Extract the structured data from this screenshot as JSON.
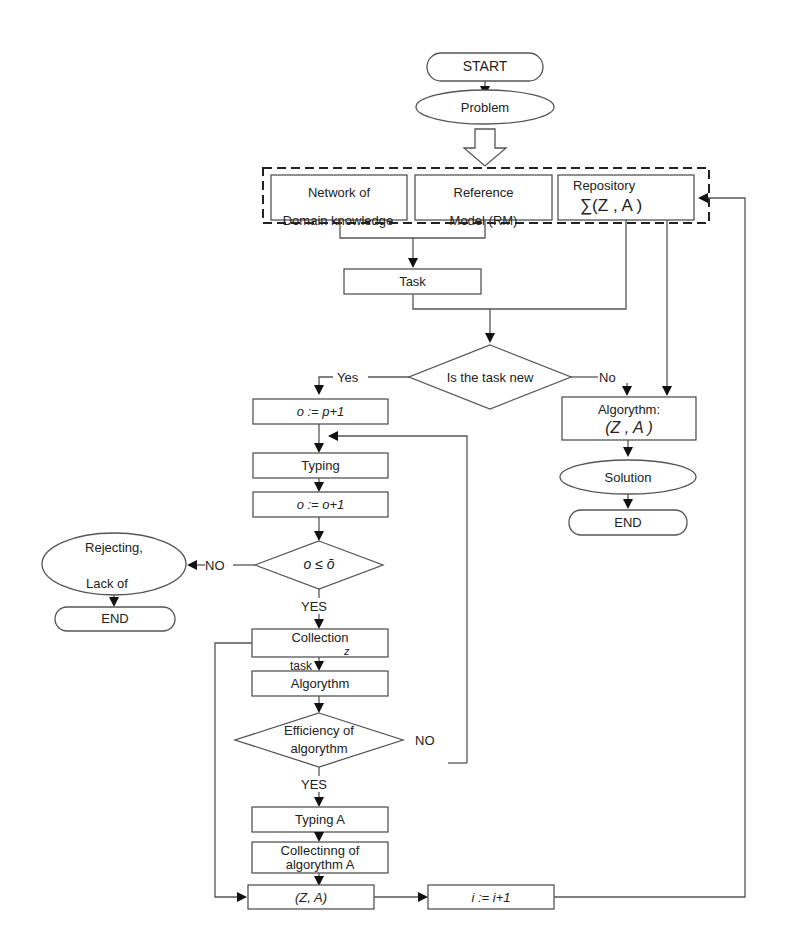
{
  "diagram": {
    "type": "flowchart",
    "nodes": {
      "start": "START",
      "problem": "Problem",
      "network_line1": "Network of",
      "network_line2": "Domain knowledge",
      "reference_line1": "Reference",
      "reference_line2": "Model (RM)",
      "repository_title": "Repository",
      "repository_formula": "∑(Z , A )",
      "task": "Task",
      "decision_new": "Is the task new",
      "yes_label": "Yes",
      "no_label": "No",
      "o_init": "o := p+1",
      "typing": "Typing",
      "o_inc": "o := o+1",
      "decision_limit": "o ≤ ō",
      "no_upper": "NO",
      "yes_upper": "YES",
      "rejecting_line1": "Rejecting,",
      "rejecting_line2": "Lack of",
      "end_left": "END",
      "collection": "Collection",
      "collection_sub": "z",
      "task_small": "task",
      "algorythm": "Algorythm",
      "decision_eff_line1": "Efficiency of",
      "decision_eff_line2": "algorythm",
      "no_eff": "NO",
      "yes_eff": "YES",
      "typing_a": "Typing A",
      "collecting_line1": "Collectinng of",
      "collecting_line2": "algorythm A",
      "za": "(Z, A)",
      "i_inc": "i := i+1",
      "algorythm_right_line1": "Algorythm:",
      "algorythm_right_line2": "(Z , A )",
      "solution": "Solution",
      "end_right": "END"
    }
  }
}
